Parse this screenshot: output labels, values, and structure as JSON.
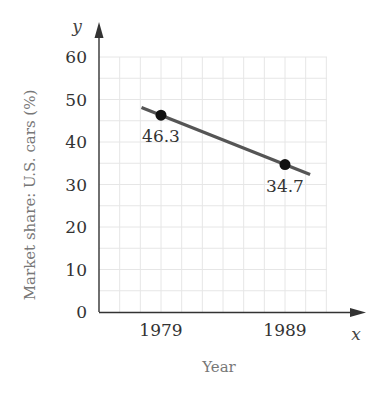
{
  "chart_data": {
    "type": "line",
    "title": "",
    "xlabel": "Year",
    "ylabel": "Market share: U.S. cars (%)",
    "x_axis_var": "x",
    "y_axis_var": "y",
    "x": [
      1979,
      1989
    ],
    "series": [
      {
        "name": "U.S. cars market share",
        "values": [
          46.3,
          34.7
        ],
        "data_labels": [
          "46.3",
          "34.7"
        ]
      }
    ],
    "x_ticks": [
      "1979",
      "1989"
    ],
    "y_ticks": [
      "0",
      "10",
      "20",
      "30",
      "40",
      "50",
      "60"
    ],
    "ylim": [
      0,
      60
    ],
    "xlim": [
      1974,
      1992.5
    ],
    "grid": true,
    "legend": "none",
    "line_extends_beyond_points": true,
    "colors": {
      "line": "#555555",
      "marker": "#111111",
      "grid": "#e6e6e6",
      "axis": "#333333",
      "axis_title": "#777777"
    }
  }
}
